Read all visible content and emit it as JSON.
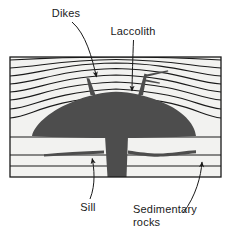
{
  "figure": {
    "type": "geologic-cross-section",
    "background_color": "#ffffff",
    "frame_color": "#1a1a1a",
    "strata_color": "#1a1a1a",
    "intrusion_color": "#4d4d4d",
    "text_color": "#1a1a1a"
  },
  "labels": {
    "dikes": "Dikes",
    "laccolith": "Laccolith",
    "sill": "Sill",
    "sedimentary_line1": "Sedimentary",
    "sedimentary_line2": "rocks"
  },
  "features": {
    "frame": {
      "left": 10,
      "right": 221,
      "top": 57,
      "bottom": 177
    },
    "laccolith": {
      "name": "laccolith-body",
      "description": "dark mushroom-shaped igneous intrusion doming the overlying strata",
      "left_extent": 32,
      "right_extent": 196,
      "crest_y": 92,
      "base_y": 136
    },
    "dikes": {
      "name": "dike-intrusions",
      "count": 2,
      "description": "near-vertical dark sheets rising from the laccolith crest and cutting the strata; the right dike branches"
    },
    "sill": {
      "name": "sill-intrusion",
      "description": "thin horizontal dark sheet injected along a bedding plane below the laccolith",
      "y": 155
    },
    "feeder": {
      "name": "feeder-conduit",
      "description": "vertical dark stem connecting the sill to the base of the laccolith and extending to the bottom of the block"
    },
    "sedimentary_rocks": {
      "name": "sedimentary-strata",
      "description": "stack of bedding-plane lines, arched upward over the laccolith and flat-lying below it",
      "bed_count": 11
    }
  },
  "leaders": [
    {
      "name": "dikes-leader",
      "from_label": "Dikes",
      "arrow_x": 97,
      "arrow_y": 81
    },
    {
      "name": "laccolith-leader",
      "from_label": "Laccolith",
      "arrow_x": 132,
      "arrow_y": 96
    },
    {
      "name": "sill-leader",
      "from_label": "Sill",
      "arrow_x": 92,
      "arrow_y": 154
    },
    {
      "name": "sedimentary-rocks-leader",
      "from_label": "Sedimentary rocks",
      "arrow_x": 202,
      "arrow_y": 157
    }
  ]
}
